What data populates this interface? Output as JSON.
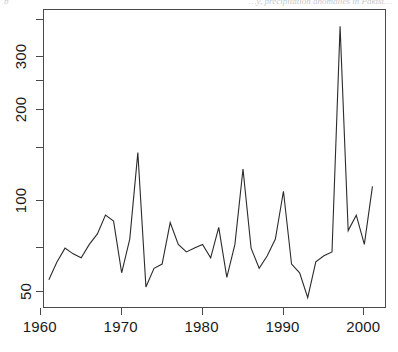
{
  "caption": {
    "top_right": "…y, precipitation anomalies in Pakist…",
    "top_left": "b"
  },
  "chart_data": {
    "type": "line",
    "title": "",
    "xlabel": "",
    "ylabel": "",
    "yscale": "log",
    "xlim": [
      1960.4,
      2002.8
    ],
    "ylim": [
      44,
      430
    ],
    "grid": false,
    "legend": null,
    "xticks": [
      1960,
      1970,
      1980,
      1990,
      2000
    ],
    "xticklabels": [
      "1960",
      "1970",
      "1980",
      "1990",
      "2000"
    ],
    "yticks": [
      50,
      100,
      200,
      300
    ],
    "yticklabels": [
      "50",
      "100",
      "200",
      "300"
    ],
    "yminorticks": [
      70,
      150,
      250,
      400
    ],
    "series_name": "annual value",
    "x": [
      1961,
      1962,
      1963,
      1964,
      1965,
      1966,
      1967,
      1968,
      1969,
      1970,
      1971,
      1972,
      1973,
      1974,
      1975,
      1976,
      1977,
      1978,
      1979,
      1980,
      1981,
      1982,
      1983,
      1984,
      1985,
      1986,
      1987,
      1988,
      1989,
      1990,
      1991,
      1992,
      1993,
      1994,
      1995,
      1996,
      1997,
      1998,
      1999,
      2000,
      2001
    ],
    "values": [
      55,
      63,
      70,
      67,
      65,
      72,
      78,
      90,
      86,
      58,
      75,
      145,
      52,
      60,
      62,
      85,
      72,
      68,
      70,
      72,
      65,
      82,
      56,
      72,
      128,
      70,
      60,
      66,
      75,
      108,
      62,
      58,
      48,
      63,
      66,
      68,
      380,
      80,
      90,
      72,
      112
    ],
    "peak": {
      "year": 1997,
      "value": 380
    },
    "annotations": []
  }
}
